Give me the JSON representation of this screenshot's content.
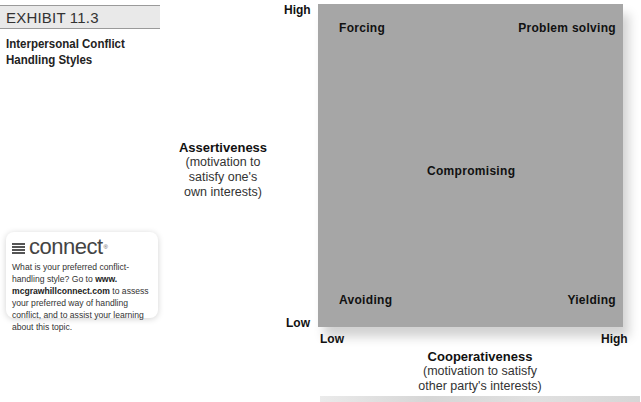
{
  "exhibit": {
    "label": "EXHIBIT 11.3",
    "title_line1": "Interpersonal Conflict",
    "title_line2": "Handling Styles"
  },
  "connect": {
    "logo_text": "connect",
    "logo_mark": "®",
    "text_1": "What is your preferred conflict-handling style? Go to ",
    "link_1": "www.",
    "link_2": "mcgrawhillconnect.com",
    "text_2": " to assess your preferred way of handling conflict, and to assist your learning about this topic."
  },
  "diagram": {
    "fill_color": "#a6a6a6",
    "quadrants": {
      "top_left": "Forcing",
      "top_right": "Problem solving",
      "center": "Compromising",
      "bottom_left": "Avoiding",
      "bottom_right": "Yielding"
    },
    "y_axis": {
      "high": "High",
      "low": "Low",
      "title": "Assertiveness",
      "subtitle_1": "(motivation to",
      "subtitle_2": "satisfy one's",
      "subtitle_3": "own interests)"
    },
    "x_axis": {
      "low": "Low",
      "high": "High",
      "title": "Cooperativeness",
      "subtitle_1": "(motivation to satisfy",
      "subtitle_2": "other party's interests)"
    }
  }
}
